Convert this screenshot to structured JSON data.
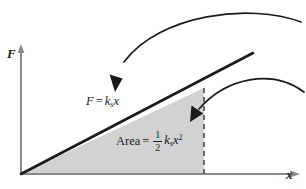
{
  "figure": {
    "background_color": "#ffffff",
    "line_color": "#1a1a1a",
    "fill_color": "#d2d2d2"
  },
  "axes": {
    "y_label": "F",
    "x_label": "x",
    "origin": {
      "x": 21,
      "y": 174
    },
    "y_axis_top": 47,
    "x_axis_right": 284
  },
  "curve": {
    "equation_text": {
      "lhs": "F",
      "equals": "=",
      "k": "k",
      "k_subscript": "s",
      "variable": "x"
    },
    "line_start": {
      "x": 21,
      "y": 174
    },
    "line_end": {
      "x": 253,
      "y": 53
    }
  },
  "area": {
    "equation_text": {
      "lhs": "Area",
      "equals": "=",
      "numerator": "1",
      "denominator": "2",
      "k": "k",
      "k_subscript": "s",
      "variable": "x",
      "exponent": "2"
    },
    "dashed_line_x": 204,
    "dashed_line_top": 88,
    "dashed_line_bottom": 174
  },
  "annotations": {
    "arrow_top": {
      "name": "arrow-to-line",
      "tip": {
        "x": 115,
        "y": 92
      },
      "tail": {
        "x": 301,
        "y": 22
      }
    },
    "arrow_bottom": {
      "name": "arrow-to-area",
      "tip": {
        "x": 190,
        "y": 122
      },
      "tail": {
        "x": 304,
        "y": 92
      }
    }
  }
}
